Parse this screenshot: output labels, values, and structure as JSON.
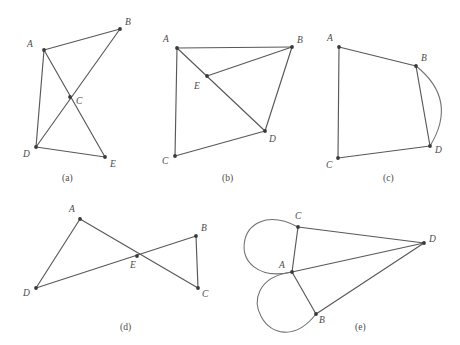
{
  "figure": {
    "background_color": "#ffffff",
    "edge_color": "#585858",
    "vertex_color": "#3a3a3a",
    "label_color": "#4a4a4a",
    "panels": [
      {
        "id": "a",
        "caption": "(a)",
        "caption_x": 62,
        "caption_y": 181,
        "vertices": [
          {
            "name": "A",
            "x": 44,
            "y": 50,
            "label_x": 27,
            "label_y": 47
          },
          {
            "name": "B",
            "x": 120,
            "y": 29,
            "label_x": 125,
            "label_y": 25
          },
          {
            "name": "C",
            "x": 70,
            "y": 97,
            "label_x": 76,
            "label_y": 104
          },
          {
            "name": "D",
            "x": 36,
            "y": 147,
            "label_x": 23,
            "label_y": 157
          },
          {
            "name": "E",
            "x": 105,
            "y": 157,
            "label_x": 110,
            "label_y": 167
          }
        ],
        "edges": [
          {
            "from": "A",
            "to": "B",
            "type": "line"
          },
          {
            "from": "A",
            "to": "D",
            "type": "line"
          },
          {
            "from": "A",
            "to": "E",
            "type": "line"
          },
          {
            "from": "B",
            "to": "D",
            "type": "line"
          },
          {
            "from": "D",
            "to": "E",
            "type": "line"
          }
        ]
      },
      {
        "id": "b",
        "caption": "(b)",
        "caption_x": 222,
        "caption_y": 181,
        "vertices": [
          {
            "name": "A",
            "x": 177,
            "y": 48,
            "label_x": 163,
            "label_y": 42
          },
          {
            "name": "B",
            "x": 292,
            "y": 47,
            "label_x": 297,
            "label_y": 43
          },
          {
            "name": "E",
            "x": 207,
            "y": 76,
            "label_x": 194,
            "label_y": 89
          },
          {
            "name": "C",
            "x": 175,
            "y": 156,
            "label_x": 162,
            "label_y": 164
          },
          {
            "name": "D",
            "x": 265,
            "y": 131,
            "label_x": 269,
            "label_y": 142
          }
        ],
        "edges": [
          {
            "from": "A",
            "to": "B",
            "type": "line"
          },
          {
            "from": "A",
            "to": "C",
            "type": "line"
          },
          {
            "from": "A",
            "to": "D",
            "type": "line"
          },
          {
            "from": "E",
            "to": "B",
            "type": "line"
          },
          {
            "from": "B",
            "to": "D",
            "type": "line"
          },
          {
            "from": "C",
            "to": "D",
            "type": "line"
          }
        ]
      },
      {
        "id": "c",
        "caption": "(c)",
        "caption_x": 383,
        "caption_y": 181,
        "vertices": [
          {
            "name": "A",
            "x": 339,
            "y": 47,
            "label_x": 327,
            "label_y": 41
          },
          {
            "name": "B",
            "x": 416,
            "y": 66,
            "label_x": 421,
            "label_y": 61
          },
          {
            "name": "D",
            "x": 430,
            "y": 146,
            "label_x": 435,
            "label_y": 153
          },
          {
            "name": "C",
            "x": 338,
            "y": 158,
            "label_x": 326,
            "label_y": 168
          }
        ],
        "edges": [
          {
            "from": "A",
            "to": "B",
            "type": "line"
          },
          {
            "from": "A",
            "to": "C",
            "type": "line"
          },
          {
            "from": "B",
            "to": "D",
            "type": "line"
          },
          {
            "from": "B",
            "to": "D",
            "type": "arc",
            "bulge": -36
          },
          {
            "from": "C",
            "to": "D",
            "type": "line"
          }
        ]
      },
      {
        "id": "d",
        "caption": "(d)",
        "caption_x": 120,
        "caption_y": 330,
        "vertices": [
          {
            "name": "A",
            "x": 80,
            "y": 219,
            "label_x": 69,
            "label_y": 212
          },
          {
            "name": "B",
            "x": 196,
            "y": 236,
            "label_x": 201,
            "label_y": 231
          },
          {
            "name": "E",
            "x": 137,
            "y": 256,
            "label_x": 130,
            "label_y": 268
          },
          {
            "name": "D",
            "x": 36,
            "y": 288,
            "label_x": 23,
            "label_y": 296
          },
          {
            "name": "C",
            "x": 198,
            "y": 288,
            "label_x": 202,
            "label_y": 297
          }
        ],
        "edges": [
          {
            "from": "A",
            "to": "D",
            "type": "line"
          },
          {
            "from": "A",
            "to": "C",
            "type": "line"
          },
          {
            "from": "D",
            "to": "B",
            "type": "line"
          },
          {
            "from": "B",
            "to": "C",
            "type": "line"
          }
        ]
      },
      {
        "id": "e",
        "caption": "(e)",
        "caption_x": 355,
        "caption_y": 330,
        "vertices": [
          {
            "name": "A",
            "x": 292,
            "y": 272,
            "label_x": 279,
            "label_y": 268
          },
          {
            "name": "C",
            "x": 298,
            "y": 227,
            "label_x": 295,
            "label_y": 219
          },
          {
            "name": "B",
            "x": 316,
            "y": 314,
            "label_x": 319,
            "label_y": 323
          },
          {
            "name": "D",
            "x": 424,
            "y": 243,
            "label_x": 429,
            "label_y": 242
          }
        ],
        "edges": [
          {
            "from": "A",
            "to": "C",
            "type": "line"
          },
          {
            "from": "A",
            "to": "C",
            "type": "loop-arc",
            "bulge": -47
          },
          {
            "from": "A",
            "to": "B",
            "type": "line"
          },
          {
            "from": "A",
            "to": "B",
            "type": "loop-arc",
            "bulge": 45
          },
          {
            "from": "C",
            "to": "D",
            "type": "line"
          },
          {
            "from": "A",
            "to": "D",
            "type": "line"
          },
          {
            "from": "B",
            "to": "D",
            "type": "line"
          }
        ]
      }
    ]
  }
}
